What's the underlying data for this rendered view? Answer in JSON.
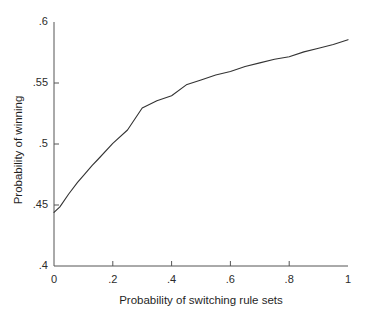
{
  "chart_data": {
    "type": "line",
    "title": "",
    "xlabel": "Probability of switching rule sets",
    "ylabel": "Probability of winning",
    "xlim": [
      0,
      1
    ],
    "ylim": [
      0.4,
      0.6
    ],
    "grid": false,
    "legend": null,
    "line_color": "#333333",
    "x_ticks": [
      0,
      0.2,
      0.4,
      0.6,
      0.8,
      1
    ],
    "x_tick_labels": [
      "0",
      ".2",
      ".4",
      ".6",
      ".8",
      "1"
    ],
    "y_ticks": [
      0.4,
      0.45,
      0.5,
      0.55,
      0.6
    ],
    "y_tick_labels": [
      ".4",
      ".45",
      ".5",
      ".55",
      ".6"
    ],
    "series": [
      {
        "name": "Probability of winning",
        "x": [
          0,
          0.02,
          0.05,
          0.08,
          0.1,
          0.13,
          0.15,
          0.2,
          0.25,
          0.3,
          0.35,
          0.4,
          0.45,
          0.5,
          0.55,
          0.6,
          0.65,
          0.7,
          0.75,
          0.8,
          0.85,
          0.9,
          0.95,
          1
        ],
        "values": [
          0.444,
          0.4485,
          0.459,
          0.4685,
          0.474,
          0.4825,
          0.4875,
          0.5005,
          0.5115,
          0.5295,
          0.5355,
          0.5395,
          0.5485,
          0.5525,
          0.5565,
          0.5595,
          0.5635,
          0.5665,
          0.5695,
          0.5715,
          0.5755,
          0.5785,
          0.5815,
          0.5855
        ]
      }
    ]
  },
  "axes": {
    "x_title": "Probability of switching rule sets",
    "y_title": "Probability of winning"
  }
}
